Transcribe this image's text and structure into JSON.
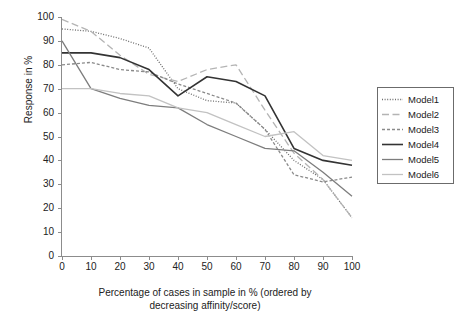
{
  "chart_data": {
    "type": "line",
    "title": "",
    "xlabel": "Percentage of cases in sample in % (ordered by decreasing affinity/score)",
    "xlabel_line1": "Percentage of cases in sample in % (ordered by",
    "xlabel_line2": "decreasing affinity/score)",
    "ylabel": "Response in %",
    "xlim": [
      0,
      100
    ],
    "ylim": [
      0,
      100
    ],
    "xticks": [
      0,
      10,
      20,
      30,
      40,
      50,
      60,
      70,
      80,
      90,
      100
    ],
    "yticks": [
      0,
      10,
      20,
      30,
      40,
      50,
      60,
      70,
      80,
      90,
      100
    ],
    "grid": false,
    "legend_position": "right",
    "x": [
      0,
      10,
      20,
      30,
      40,
      50,
      60,
      70,
      80,
      90,
      100
    ],
    "series": [
      {
        "name": "Model1",
        "values": [
          95,
          94,
          91,
          87,
          70,
          65,
          64,
          53,
          40,
          32,
          16
        ],
        "style": "dotted",
        "color": "#6e6e6e",
        "width": 1.3
      },
      {
        "name": "Model2",
        "values": [
          99,
          94,
          84,
          76,
          73,
          78,
          80,
          61,
          43,
          32,
          16
        ],
        "style": "longdash",
        "color": "#b4b4b4",
        "width": 1.3
      },
      {
        "name": "Model3",
        "values": [
          80,
          81,
          78,
          77,
          72,
          68,
          64,
          53,
          34,
          31,
          33
        ],
        "style": "shortdash",
        "color": "#8a8a8a",
        "width": 1.3
      },
      {
        "name": "Model4",
        "values": [
          85,
          85,
          83,
          78,
          67,
          75,
          73,
          67,
          45,
          40,
          38
        ],
        "style": "solid",
        "color": "#333333",
        "width": 1.6
      },
      {
        "name": "Model5",
        "values": [
          90,
          70,
          66,
          63,
          62,
          55,
          50,
          45,
          44,
          35,
          25
        ],
        "style": "solid",
        "color": "#7d7d7d",
        "width": 1.3
      },
      {
        "name": "Model6",
        "values": [
          70,
          70,
          68,
          67,
          62,
          60,
          55,
          50,
          52,
          42,
          40
        ],
        "style": "solid",
        "color": "#c2c2c2",
        "width": 1.3
      }
    ]
  },
  "legend": {
    "items": [
      {
        "label": "Model1"
      },
      {
        "label": "Model2"
      },
      {
        "label": "Model3"
      },
      {
        "label": "Model4"
      },
      {
        "label": "Model5"
      },
      {
        "label": "Model6"
      }
    ]
  }
}
